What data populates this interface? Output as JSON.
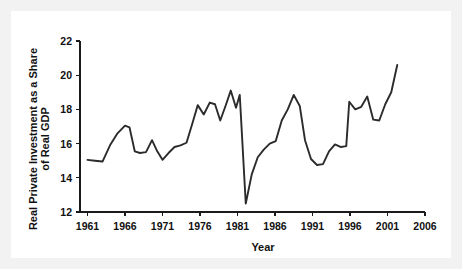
{
  "chart_data": {
    "type": "line",
    "title": "",
    "xlabel": "Year",
    "ylabel": "Real Private Investment as a Share of Real GDP",
    "ylabel_line1": "Real Private Investment as a Share",
    "ylabel_line2": "of Real GDP",
    "xlim": [
      1960,
      2006
    ],
    "ylim": [
      12,
      22
    ],
    "xticks": [
      1961,
      1966,
      1971,
      1976,
      1981,
      1986,
      1991,
      1996,
      2001,
      2006
    ],
    "xtick_labels": [
      "1961",
      "1966",
      "1971",
      "1976",
      "1981",
      "1986",
      "1991",
      "1996",
      "2001",
      "2006"
    ],
    "yticks": [
      12,
      14,
      16,
      18,
      20,
      22
    ],
    "ytick_labels": [
      "12",
      "14",
      "16",
      "18",
      "20",
      "22"
    ],
    "grid": false,
    "legend": null,
    "line_color": "#2b2b2b",
    "background_color": "#ffffff",
    "frame_color": "#f2f2f2",
    "x": [
      1961,
      1962,
      1963,
      1964,
      1965,
      1966,
      1967,
      1968,
      1969,
      1970,
      1971,
      1972,
      1973,
      1974,
      1975,
      1976,
      1977,
      1978,
      1979,
      1980,
      1981,
      1982,
      1983,
      1984,
      1985,
      1986,
      1987,
      1988,
      1989,
      1990,
      1991,
      1992,
      1993,
      1994,
      1995,
      1996,
      1997,
      1998,
      1999,
      2000,
      2001,
      2002,
      2003,
      2004,
      2005
    ],
    "values": [
      15.05,
      15.0,
      14.95,
      15.9,
      16.6,
      17.05,
      16.6,
      15.5,
      15.45,
      16.2,
      15.5,
      15.05,
      15.5,
      15.9,
      16.0,
      17.2,
      18.25,
      17.7,
      18.4,
      18.3,
      17.35,
      18.2,
      19.1,
      18.1,
      18.85,
      12.5,
      13.5,
      15.2,
      15.8,
      16.0,
      16.1,
      17.3,
      18.85,
      17.7,
      16.2,
      15.1,
      14.75,
      14.9,
      15.5,
      15.95,
      15.8,
      18.45,
      18.0,
      18.15,
      18.75
    ],
    "series_points": [
      [
        1961,
        15.05
      ],
      [
        1962,
        15.0
      ],
      [
        1963,
        14.95
      ],
      [
        1964,
        15.9
      ],
      [
        1965,
        16.6
      ],
      [
        1966,
        17.05
      ],
      [
        1967,
        16.6
      ],
      [
        1968,
        15.5
      ],
      [
        1969,
        15.45
      ],
      [
        1970,
        16.2
      ],
      [
        1971,
        15.5
      ],
      [
        1972,
        15.05
      ],
      [
        1973,
        15.5
      ],
      [
        1974,
        15.9
      ],
      [
        1975,
        16.0
      ],
      [
        1976,
        17.2
      ],
      [
        1977,
        18.25
      ],
      [
        1978,
        17.7
      ],
      [
        1979,
        18.4
      ],
      [
        1980,
        18.3
      ],
      [
        1981,
        17.35
      ],
      [
        1982,
        18.2
      ],
      [
        1983,
        19.1
      ],
      [
        1984,
        18.1
      ],
      [
        1985,
        18.85
      ],
      [
        1986,
        12.5
      ],
      [
        1987,
        13.5
      ],
      [
        1988,
        15.2
      ],
      [
        1989,
        15.8
      ],
      [
        1990,
        16.0
      ],
      [
        1991,
        16.1
      ],
      [
        1992,
        17.3
      ],
      [
        1993,
        18.85
      ],
      [
        1994,
        17.7
      ],
      [
        1995,
        16.2
      ],
      [
        1996,
        15.1
      ],
      [
        1997,
        14.75
      ],
      [
        1998,
        14.9
      ],
      [
        1999,
        15.5
      ],
      [
        2000,
        15.95
      ],
      [
        2001,
        15.8
      ],
      [
        2002,
        18.45
      ],
      [
        2003,
        18.0
      ],
      [
        2004,
        18.15
      ],
      [
        2005,
        18.75
      ]
    ],
    "plotted_series": [
      [
        1961.0,
        15.05
      ],
      [
        1962.0,
        15.0
      ],
      [
        1963.0,
        14.95
      ],
      [
        1964.0,
        15.9
      ],
      [
        1965.0,
        16.6
      ],
      [
        1966.0,
        17.05
      ],
      [
        1966.6,
        16.95
      ],
      [
        1967.3,
        15.55
      ],
      [
        1968.0,
        15.45
      ],
      [
        1968.8,
        15.5
      ],
      [
        1969.6,
        16.2
      ],
      [
        1970.3,
        15.55
      ],
      [
        1971.0,
        15.05
      ],
      [
        1971.8,
        15.45
      ],
      [
        1972.6,
        15.8
      ],
      [
        1973.4,
        15.9
      ],
      [
        1974.2,
        16.05
      ],
      [
        1975.0,
        17.2
      ],
      [
        1975.7,
        18.25
      ],
      [
        1976.5,
        17.7
      ],
      [
        1977.3,
        18.4
      ],
      [
        1978.0,
        18.3
      ],
      [
        1978.7,
        17.35
      ],
      [
        1979.4,
        18.2
      ],
      [
        1980.1,
        19.1
      ],
      [
        1980.8,
        18.1
      ],
      [
        1981.3,
        18.85
      ],
      [
        1982.1,
        12.5
      ],
      [
        1982.9,
        14.2
      ],
      [
        1983.7,
        15.2
      ],
      [
        1984.5,
        15.65
      ],
      [
        1985.3,
        16.0
      ],
      [
        1986.1,
        16.15
      ],
      [
        1986.9,
        17.35
      ],
      [
        1987.7,
        18.0
      ],
      [
        1988.5,
        18.85
      ],
      [
        1989.3,
        18.2
      ],
      [
        1990.0,
        16.2
      ],
      [
        1990.8,
        15.1
      ],
      [
        1991.6,
        14.75
      ],
      [
        1992.4,
        14.8
      ],
      [
        1993.2,
        15.55
      ],
      [
        1994.0,
        15.95
      ],
      [
        1994.8,
        15.8
      ],
      [
        1995.5,
        15.85
      ],
      [
        1995.9,
        18.45
      ],
      [
        1996.7,
        18.0
      ],
      [
        1997.5,
        18.15
      ],
      [
        1998.3,
        18.75
      ],
      [
        1999.1,
        17.4
      ],
      [
        1999.9,
        17.35
      ],
      [
        2000.7,
        18.3
      ],
      [
        2001.5,
        19.0
      ],
      [
        2002.3,
        20.6
      ]
    ],
    "annotations": [],
    "axes": {
      "x_axis_name": "x-axis",
      "y_axis_name": "y-axis"
    }
  }
}
